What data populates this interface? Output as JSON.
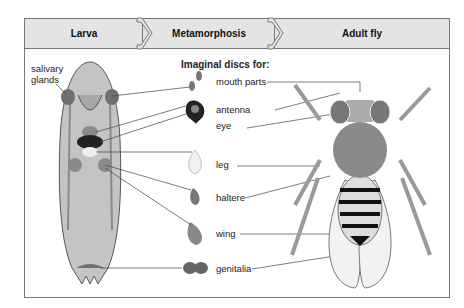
{
  "header": {
    "stages": [
      {
        "label": "Larva"
      },
      {
        "label": "Metamorphosis"
      },
      {
        "label": "Adult fly"
      }
    ]
  },
  "larva": {
    "salivary_label_1": "salivary",
    "salivary_label_2": "glands"
  },
  "discs": {
    "title": "Imaginal discs for:",
    "items": [
      {
        "label": "mouth parts"
      },
      {
        "label": "antenna"
      },
      {
        "label": "eye"
      },
      {
        "label": "leg"
      },
      {
        "label": "haltere"
      },
      {
        "label": "wing"
      },
      {
        "label": "genitalia"
      }
    ]
  },
  "colors": {
    "header_fill": "#e4e4e4",
    "larva_body": "#c8c8c8",
    "disc_fill": "#8a8a8a",
    "border": "#777777"
  }
}
